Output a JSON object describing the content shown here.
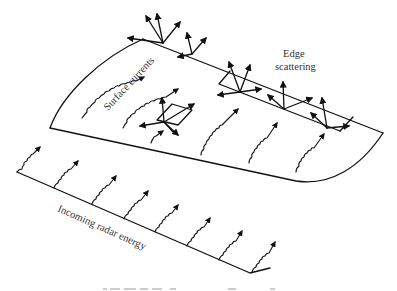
{
  "figure": {
    "labels": {
      "surface_currents": "Surface currents",
      "edge_scattering_line1": "Edge",
      "edge_scattering_line2": "scattering",
      "incoming_radar": "Incoming radar energy"
    },
    "colors": {
      "stroke": "#111111",
      "label": "#333333",
      "background": "#ffffff"
    },
    "elements": {
      "plate": "curved flat plate seen in perspective",
      "incoming_wave_arrows": 8,
      "surface_current_lines": 6,
      "edge_scattering_sites": 3,
      "surface_discontinuity_patch": 1
    }
  }
}
